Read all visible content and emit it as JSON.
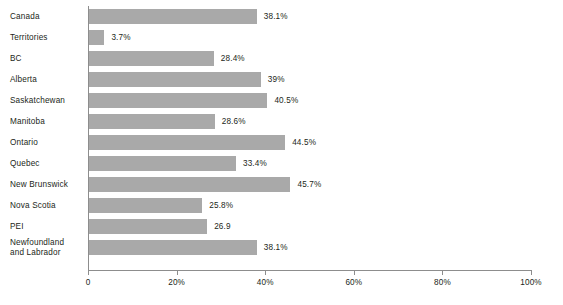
{
  "chart_data": {
    "type": "bar",
    "orientation": "horizontal",
    "title": "",
    "subtitle": "",
    "xlabel": "",
    "ylabel": "",
    "xlim": [
      0,
      100
    ],
    "grid": false,
    "legend": false,
    "categories": [
      "Canada",
      "Territories",
      "BC",
      "Alberta",
      "Saskatchewan",
      "Manitoba",
      "Ontario",
      "Quebec",
      "New Brunswick",
      "Nova Scotia",
      "PEI",
      "Newfoundland\nand Labrador"
    ],
    "values": [
      38.1,
      3.7,
      28.4,
      39,
      40.5,
      28.6,
      44.5,
      33.4,
      45.7,
      25.8,
      26.9,
      38.1
    ],
    "data_labels": [
      "38.1%",
      "3.7%",
      "28.4%",
      "39%",
      "40.5%",
      "28.6%",
      "44.5%",
      "33.4%",
      "45.7%",
      "25.8%",
      "26.9",
      "38.1%"
    ],
    "xticks": [
      0,
      20,
      40,
      60,
      80,
      100
    ],
    "xtick_labels": [
      "0",
      "20%",
      "40%",
      "60%",
      "80%",
      "100%"
    ],
    "bar_color": "#a9a9a9",
    "axis_color": "#8d8d8d",
    "text_color": "#231f20",
    "background_color": "#ffffff"
  }
}
